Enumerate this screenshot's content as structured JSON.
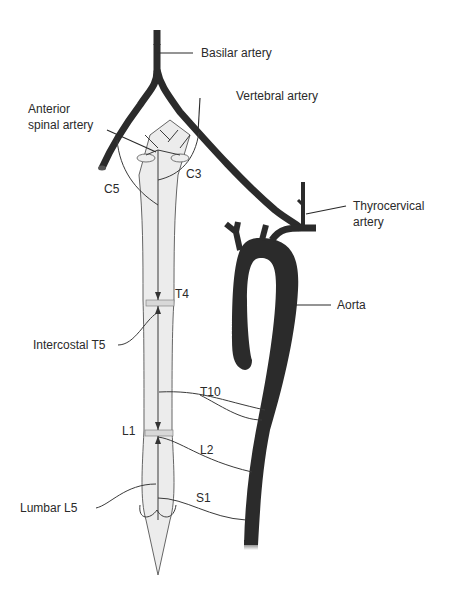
{
  "diagram": {
    "colors": {
      "vessel": "#2b2b2b",
      "cord_fill": "#ececec",
      "cord_stroke": "#555555",
      "label": "#2a2a2a",
      "background": "#ffffff"
    },
    "labels": {
      "basilar": "Basilar artery",
      "vertebral": "Vertebral artery",
      "anterior_spinal_1": "Anterior",
      "anterior_spinal_2": "spinal artery",
      "c5": "C5",
      "c3": "C3",
      "thyrocervical_1": "Thyrocervical",
      "thyrocervical_2": "artery",
      "aorta": "Aorta",
      "t4": "T4",
      "intercostal_t5": "Intercostal T5",
      "t10": "T10",
      "l1": "L1",
      "l2": "L2",
      "lumbar_l5": "Lumbar L5",
      "s1": "S1"
    }
  }
}
